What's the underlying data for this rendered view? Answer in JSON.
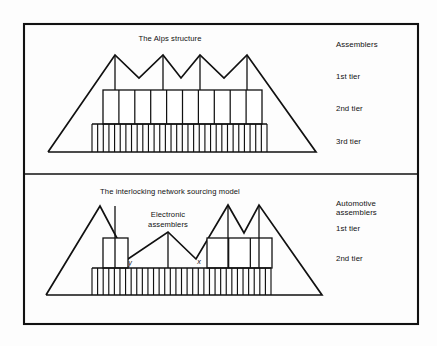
{
  "figure": {
    "background_color": "#fdfdfd",
    "ink_color": "#111111",
    "frame": {
      "x": 24,
      "y": 24,
      "width": 394,
      "height": 300
    },
    "divider_y": 174
  },
  "panels": [
    {
      "id": "alps",
      "title": "The Alps structure",
      "title_x": 170,
      "title_y": 41,
      "side_labels": [
        {
          "text": "Assemblers",
          "x": 336,
          "y": 47
        },
        {
          "text": "1st tier",
          "x": 336,
          "y": 79
        },
        {
          "text": "2nd tier",
          "x": 336,
          "y": 111
        },
        {
          "text": "3rd tier",
          "x": 336,
          "y": 144
        }
      ],
      "mountain": {
        "base_left_x": 48,
        "base_right_x": 316,
        "base_y": 152,
        "apex_y": 55,
        "valley_y": 78,
        "peaks_x": [
          115,
          163,
          200,
          247
        ],
        "valleys_x": [
          139,
          181,
          224
        ]
      },
      "tier1": {
        "drop_top_y": 55,
        "drop_bottom_y": 90,
        "drop_x": [
          115,
          163,
          200,
          247
        ]
      },
      "tier2": {
        "band_left_x": 103,
        "band_right_x": 262,
        "band_top_y": 90,
        "band_bottom_y": 124,
        "cell_count": 10
      },
      "tier3": {
        "band_left_x": 92,
        "band_right_x": 267,
        "band_top_y": 124,
        "band_bottom_y": 152,
        "tooth_count": 32
      }
    },
    {
      "id": "interlocking",
      "title": "The interlocking network sourcing model",
      "title_x": 170,
      "title_y": 194,
      "side_labels": [
        {
          "text": "Automotive",
          "x": 336,
          "y": 206
        },
        {
          "text": "assemblers",
          "x": 336,
          "y": 215
        },
        {
          "text": "1st tier",
          "x": 336,
          "y": 231
        },
        {
          "text": "2nd tier",
          "x": 336,
          "y": 261
        }
      ],
      "inline_labels": [
        {
          "text": "Electronic",
          "x": 168,
          "y": 217
        },
        {
          "text": "assemblers",
          "x": 168,
          "y": 227
        }
      ],
      "node_labels": [
        {
          "text": "y",
          "x": 130,
          "y": 265
        },
        {
          "text": "x",
          "x": 199,
          "y": 264
        }
      ],
      "mountain": {
        "base_left_x": 46,
        "base_right_x": 322,
        "base_y": 295,
        "ridge": [
          {
            "x": 46,
            "y": 295
          },
          {
            "x": 100,
            "y": 206
          },
          {
            "x": 128,
            "y": 259
          },
          {
            "x": 168,
            "y": 232
          },
          {
            "x": 196,
            "y": 259
          },
          {
            "x": 228,
            "y": 205
          },
          {
            "x": 244,
            "y": 233
          },
          {
            "x": 259,
            "y": 205
          },
          {
            "x": 322,
            "y": 295
          }
        ]
      },
      "tier1_left_box": {
        "left_x": 103,
        "right_x": 128,
        "top_y": 238,
        "bottom_y": 268,
        "drop_x": 115,
        "drop_top_y": 206
      },
      "tier1_mid_drop": {
        "drop_x": 168,
        "drop_top_y": 232,
        "drop_bottom_y": 268
      },
      "tier1_right_band": {
        "left_x": 207,
        "right_x": 272,
        "top_y": 238,
        "bottom_y": 268,
        "cell_count": 3,
        "drop_x": [
          228,
          259
        ],
        "drop_top_y": 205
      },
      "tier2": {
        "band_left_x": 92,
        "band_right_x": 271,
        "band_top_y": 268,
        "band_bottom_y": 295,
        "tooth_count": 33
      }
    }
  ]
}
